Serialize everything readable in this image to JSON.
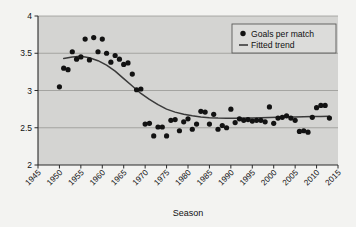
{
  "chart_data": {
    "type": "scatter",
    "title": "",
    "xlabel": "Season",
    "ylabel": "",
    "xlim": [
      1945,
      2015
    ],
    "ylim": [
      2,
      4
    ],
    "grid": true,
    "legend_position": "top-right",
    "xticks": [
      "1945",
      "1950",
      "1955",
      "1960",
      "1965",
      "1970",
      "1975",
      "1980",
      "1985",
      "1990",
      "1995",
      "2000",
      "2005",
      "2010",
      "2015"
    ],
    "xtick_values": [
      1945,
      1950,
      1955,
      1960,
      1965,
      1970,
      1975,
      1980,
      1985,
      1990,
      1995,
      2000,
      2005,
      2010,
      2015
    ],
    "yticks": [
      "2",
      "2.5",
      "3",
      "3.5",
      "4"
    ],
    "ytick_values": [
      2,
      2.5,
      3,
      3.5,
      4
    ],
    "series": [
      {
        "name": "Goals per match",
        "type": "scatter",
        "marker": "circle",
        "color": "#121212",
        "x": [
          1950,
          1951,
          1952,
          1953,
          1954,
          1955,
          1956,
          1957,
          1958,
          1959,
          1960,
          1961,
          1962,
          1963,
          1964,
          1965,
          1966,
          1967,
          1968,
          1969,
          1970,
          1971,
          1972,
          1973,
          1974,
          1975,
          1976,
          1977,
          1978,
          1979,
          1980,
          1981,
          1982,
          1983,
          1984,
          1985,
          1986,
          1987,
          1988,
          1989,
          1990,
          1991,
          1992,
          1993,
          1994,
          1995,
          1996,
          1997,
          1998,
          1999,
          2000,
          2001,
          2002,
          2003,
          2004,
          2005,
          2006,
          2007,
          2008,
          2009,
          2010,
          2011,
          2012,
          2013
        ],
        "y": [
          3.05,
          3.3,
          3.28,
          3.52,
          3.42,
          3.45,
          3.69,
          3.41,
          3.71,
          3.52,
          3.69,
          3.5,
          3.38,
          3.47,
          3.42,
          3.35,
          3.37,
          3.22,
          3.01,
          3.02,
          2.55,
          2.56,
          2.39,
          2.51,
          2.51,
          2.39,
          2.6,
          2.61,
          2.46,
          2.58,
          2.62,
          2.48,
          2.55,
          2.72,
          2.71,
          2.55,
          2.68,
          2.48,
          2.53,
          2.5,
          2.75,
          2.57,
          2.62,
          2.6,
          2.61,
          2.59,
          2.6,
          2.6,
          2.58,
          2.78,
          2.56,
          2.63,
          2.64,
          2.66,
          2.63,
          2.6,
          2.45,
          2.46,
          2.44,
          2.64,
          2.77,
          2.8,
          2.8,
          2.63
        ]
      },
      {
        "name": "Fitted trend",
        "type": "line",
        "color": "#3a3a3a",
        "x": [
          1951,
          1953,
          1955,
          1957,
          1959,
          1961,
          1963,
          1965,
          1967,
          1969,
          1971,
          1973,
          1975,
          1977,
          1979,
          1981,
          1983,
          1985,
          1987,
          1989,
          1991,
          1993,
          1995,
          1997,
          1999,
          2001,
          2003,
          2005,
          2007,
          2009,
          2011,
          2013
        ],
        "y": [
          3.43,
          3.45,
          3.46,
          3.44,
          3.4,
          3.34,
          3.26,
          3.16,
          3.06,
          2.96,
          2.88,
          2.81,
          2.75,
          2.71,
          2.68,
          2.66,
          2.645,
          2.635,
          2.63,
          2.628,
          2.628,
          2.63,
          2.632,
          2.635,
          2.638,
          2.64,
          2.643,
          2.645,
          2.648,
          2.65,
          2.652,
          2.655
        ]
      }
    ],
    "legend": [
      {
        "label": "Goals per match",
        "marker": "circle",
        "color": "#121212"
      },
      {
        "label": "Fitted trend",
        "marker": "line",
        "color": "#3a3a3a"
      }
    ],
    "colors": {
      "plot_background": "#d4d4d2",
      "page_background": "#f3f3f1",
      "gridline": "#8f8f8d",
      "axis": "#2a2a2a",
      "point": "#121212",
      "trend": "#3a3a3a",
      "legend_background": "#dcdcda",
      "legend_border": "#5a5a58"
    }
  }
}
